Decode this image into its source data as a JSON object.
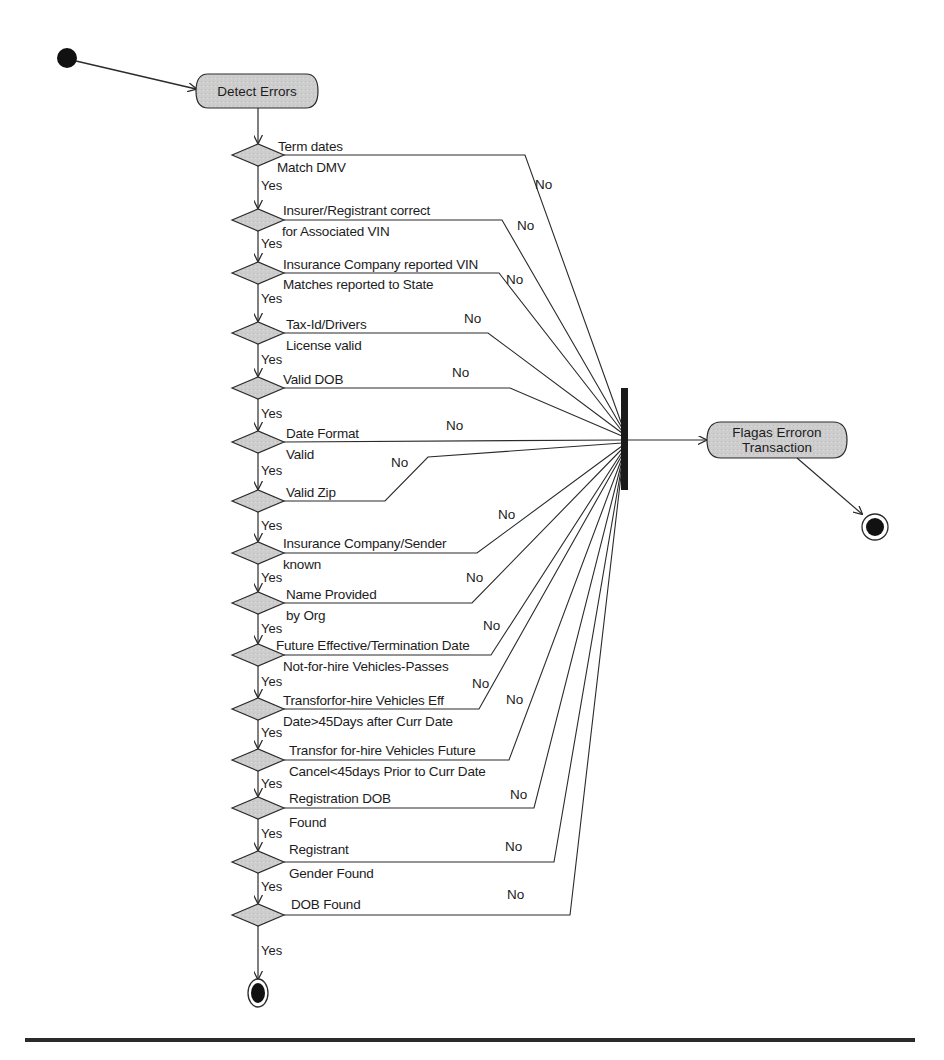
{
  "diagram": {
    "type": "UML activity diagram",
    "start_node": {
      "x": 67,
      "y": 58
    },
    "start_action": {
      "label": "Detect Errors"
    },
    "decisions": [
      {
        "line1": "Term dates",
        "line2": "Match DMV",
        "yes": "Yes",
        "no": "No",
        "y": 155
      },
      {
        "line1": "Insurer/Registrant correct",
        "line2": "for Associated VIN",
        "yes": "Yes",
        "no": "No",
        "y": 220
      },
      {
        "line1": "Insurance Company reported VIN",
        "line2": "Matches reported to State",
        "yes": "Yes",
        "no": "No",
        "y": 273
      },
      {
        "line1": "Tax-Id/Drivers",
        "line2": "License valid",
        "yes": "Yes",
        "no": "No",
        "y": 333
      },
      {
        "line1": "Valid DOB",
        "line2": "",
        "yes": "Yes",
        "no": "No",
        "y": 388
      },
      {
        "line1": "Date Format",
        "line2": "Valid",
        "yes": "Yes",
        "no": "No",
        "y": 442
      },
      {
        "line1": "Valid Zip",
        "line2": "",
        "yes": "Yes",
        "no": "No",
        "y": 501
      },
      {
        "line1": "Insurance Company/Sender",
        "line2": "known",
        "yes": "Yes",
        "no": "No",
        "y": 553
      },
      {
        "line1": "Name Provided",
        "line2": "by Org",
        "yes": "Yes",
        "no": "No",
        "y": 603
      },
      {
        "line1": "Future Effective/Termination Date",
        "line2": "Not-for-hire Vehicles-Passes",
        "yes": "Yes",
        "no": "No",
        "y": 655
      },
      {
        "line1": "Transforfor-hire Vehicles Eff",
        "line2": "Date>45Days after Curr Date",
        "yes": "Yes",
        "no": "No",
        "y": 709
      },
      {
        "line1": "Transfor for-hire Vehicles Future",
        "line2": "Cancel<45days Prior to Curr Date",
        "yes": "Yes",
        "no": "No",
        "y": 760
      },
      {
        "line1": "Registration DOB",
        "line2": "Found",
        "yes": "Yes",
        "no": "No",
        "y": 808
      },
      {
        "line1": "Registrant",
        "line2": "Gender Found",
        "yes": "Yes",
        "no": "No",
        "y": 862
      },
      {
        "line1": "DOB Found",
        "line2": "",
        "yes": "Yes",
        "no": "No",
        "y": 915
      }
    ],
    "final_yes_label": "Yes",
    "join_bar": {
      "x": 622,
      "y1": 388,
      "y2": 490
    },
    "error_action": {
      "line1": "Flagas Erroron",
      "line2": "Transaction"
    },
    "end_nodes": [
      {
        "id": "success-end",
        "x": 258,
        "y": 993
      },
      {
        "id": "error-end",
        "x": 875,
        "y": 527
      }
    ],
    "colors": {
      "stroke": "#2b2b2b",
      "fill": "#cfcfcf",
      "node": "#111111",
      "rule": "#2a2a2a"
    }
  }
}
